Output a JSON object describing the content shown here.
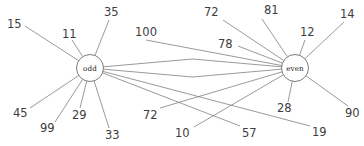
{
  "diagram": {
    "type": "node-link-graph",
    "title": "",
    "background_color": "#ffffff",
    "edge_color": "#6f6f6f",
    "label_color": "#3d3d3d",
    "hubs": [
      {
        "id": "odd",
        "label": "odd",
        "cx": 90,
        "cy": 68,
        "r": 13.5
      },
      {
        "id": "even",
        "label": "even",
        "cx": 295,
        "cy": 68,
        "r": 13.5
      }
    ],
    "leaves": [
      {
        "id": "n15",
        "label": "15",
        "hub": "odd",
        "x": 7,
        "y": 18,
        "ax": 25,
        "ay": 26
      },
      {
        "id": "n11",
        "label": "11",
        "hub": "odd",
        "x": 62,
        "y": 28,
        "ax": 72,
        "ay": 40
      },
      {
        "id": "n35",
        "label": "35",
        "hub": "odd",
        "x": 104,
        "y": 6,
        "ax": 109,
        "ay": 20
      },
      {
        "id": "n100",
        "label": "100",
        "hub": "even",
        "x": 135,
        "y": 26,
        "ax": 146,
        "ay": 40
      },
      {
        "id": "n45",
        "label": "45",
        "hub": "odd",
        "x": 13,
        "y": 107,
        "ax": 30,
        "ay": 108
      },
      {
        "id": "n99",
        "label": "99",
        "hub": "odd",
        "x": 40,
        "y": 122,
        "ax": 55,
        "ay": 122
      },
      {
        "id": "n29",
        "label": "29",
        "hub": "odd",
        "x": 72,
        "y": 109,
        "ax": 80,
        "ay": 108
      },
      {
        "id": "n33",
        "label": "33",
        "hub": "odd",
        "x": 105,
        "y": 129,
        "ax": 109,
        "ay": 128
      },
      {
        "id": "n72b",
        "label": "72",
        "hub": "even",
        "x": 143,
        "y": 109,
        "ax": 160,
        "ay": 108
      },
      {
        "id": "n10",
        "label": "10",
        "hub": "even",
        "x": 175,
        "y": 127,
        "ax": 194,
        "ay": 127
      },
      {
        "id": "n57",
        "label": "57",
        "hub": "odd",
        "x": 242,
        "y": 127,
        "ax": 240,
        "ay": 126
      },
      {
        "id": "n19",
        "label": "19",
        "hub": "odd",
        "x": 312,
        "y": 126,
        "ax": 310,
        "ay": 126
      },
      {
        "id": "n72a",
        "label": "72",
        "hub": "even",
        "x": 204,
        "y": 6,
        "ax": 223,
        "ay": 20
      },
      {
        "id": "n81",
        "label": "81",
        "hub": "even",
        "x": 264,
        "y": 4,
        "ax": 262,
        "ay": 19
      },
      {
        "id": "n78",
        "label": "78",
        "hub": "even",
        "x": 218,
        "y": 38,
        "ax": 238,
        "ay": 46
      },
      {
        "id": "n12",
        "label": "12",
        "hub": "even",
        "x": 300,
        "y": 26,
        "ax": 305,
        "ay": 40
      },
      {
        "id": "n14",
        "label": "14",
        "hub": "even",
        "x": 340,
        "y": 8,
        "ax": 344,
        "ay": 22
      },
      {
        "id": "n28",
        "label": "28",
        "hub": "even",
        "x": 277,
        "y": 102,
        "ax": 288,
        "ay": 102
      },
      {
        "id": "n90",
        "label": "90",
        "hub": "even",
        "x": 345,
        "y": 107,
        "ax": 348,
        "ay": 106
      }
    ],
    "hub_links": [
      {
        "from": "odd",
        "to": "even",
        "bow": -9
      },
      {
        "from": "odd",
        "to": "even",
        "bow": 9
      }
    ]
  }
}
